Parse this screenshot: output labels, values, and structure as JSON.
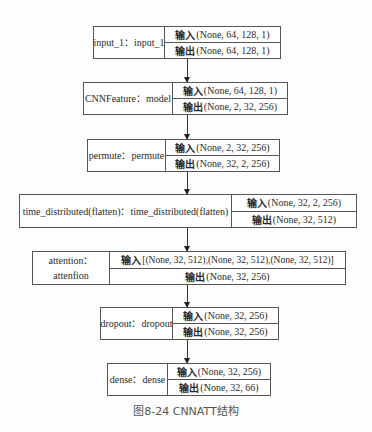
{
  "diagram": {
    "caption": "图8-24   CNNATT结构",
    "io_labels": {
      "input": "输入",
      "output": "输出"
    },
    "nodes": [
      {
        "name": "input_1：input_1",
        "input": "(None, 64, 128, 1)",
        "output": "(None, 64, 128, 1)"
      },
      {
        "name": "CNNFeature：model",
        "input": "(None, 64, 128, 1)",
        "output": "(None, 2, 32, 256)"
      },
      {
        "name": "permute：permute",
        "input": "(None, 2, 32, 256)",
        "output": "(None, 32, 2, 256)"
      },
      {
        "name": "time_distributed(flatten)：time_distributed(flatten)",
        "input": "(None, 32, 2, 256)",
        "output": "(None, 32, 512)"
      },
      {
        "name_line1": "attention：",
        "name_line2": "attenfion",
        "input": "[(None, 32, 512),(None, 32, 512),(None, 32, 512)]",
        "output": "(None, 32, 256)"
      },
      {
        "name": "dropout：dropout",
        "input": "(None, 32, 256)",
        "output": "(None, 32, 256)"
      },
      {
        "name": "dense：dense",
        "input": "(None, 32, 256)",
        "output": "(None, 32, 66)"
      }
    ],
    "edges": [
      [
        0,
        1
      ],
      [
        1,
        2
      ],
      [
        2,
        3
      ],
      [
        3,
        4
      ],
      [
        4,
        5
      ],
      [
        5,
        6
      ]
    ]
  }
}
